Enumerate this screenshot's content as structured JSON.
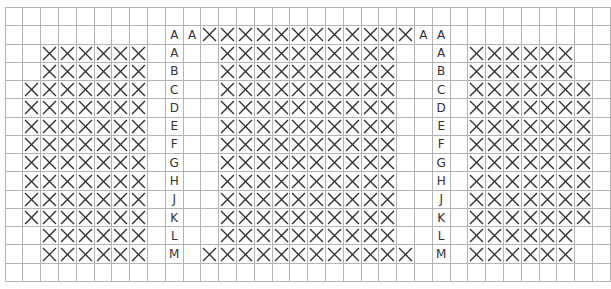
{
  "grid": {
    "columns": 34,
    "rows": 15
  },
  "colors": {
    "grid_line": "#b4b4b4",
    "mark": "#2e2e2e",
    "label": "#333333"
  },
  "mark_symbol": "X",
  "rows": [
    {
      "row_index": 0,
      "labels": [],
      "marked_seats": []
    },
    {
      "row_index": 1,
      "labels": [
        {
          "col": 9,
          "text": "A"
        },
        {
          "col": 10,
          "text": "A"
        },
        {
          "col": 23,
          "text": "A"
        },
        {
          "col": 24,
          "text": "A"
        }
      ],
      "marked_seats": [
        {
          "section": "center",
          "from": 11,
          "to": 22
        }
      ]
    },
    {
      "row_index": 2,
      "labels": [
        {
          "col": 9,
          "text": "A"
        },
        {
          "col": 24,
          "text": "A"
        }
      ],
      "marked_seats": [
        {
          "section": "left",
          "from": 2,
          "to": 7
        },
        {
          "section": "center",
          "from": 12,
          "to": 21
        },
        {
          "section": "right",
          "from": 26,
          "to": 31
        }
      ]
    },
    {
      "row_index": 3,
      "labels": [
        {
          "col": 9,
          "text": "B"
        },
        {
          "col": 24,
          "text": "B"
        }
      ],
      "marked_seats": [
        {
          "section": "left",
          "from": 2,
          "to": 7
        },
        {
          "section": "center",
          "from": 12,
          "to": 21
        },
        {
          "section": "right",
          "from": 26,
          "to": 31
        }
      ]
    },
    {
      "row_index": 4,
      "labels": [
        {
          "col": 9,
          "text": "C"
        },
        {
          "col": 24,
          "text": "C"
        }
      ],
      "marked_seats": [
        {
          "section": "left",
          "from": 1,
          "to": 7
        },
        {
          "section": "center",
          "from": 12,
          "to": 21
        },
        {
          "section": "right",
          "from": 26,
          "to": 32
        }
      ]
    },
    {
      "row_index": 5,
      "labels": [
        {
          "col": 9,
          "text": "D"
        },
        {
          "col": 24,
          "text": "D"
        }
      ],
      "marked_seats": [
        {
          "section": "left",
          "from": 1,
          "to": 7
        },
        {
          "section": "center",
          "from": 12,
          "to": 21
        },
        {
          "section": "right",
          "from": 26,
          "to": 32
        }
      ]
    },
    {
      "row_index": 6,
      "labels": [
        {
          "col": 9,
          "text": "E"
        },
        {
          "col": 24,
          "text": "E"
        }
      ],
      "marked_seats": [
        {
          "section": "left",
          "from": 1,
          "to": 7
        },
        {
          "section": "center",
          "from": 12,
          "to": 21
        },
        {
          "section": "right",
          "from": 26,
          "to": 32
        }
      ]
    },
    {
      "row_index": 7,
      "labels": [
        {
          "col": 9,
          "text": "F"
        },
        {
          "col": 24,
          "text": "F"
        }
      ],
      "marked_seats": [
        {
          "section": "left",
          "from": 1,
          "to": 7
        },
        {
          "section": "center",
          "from": 12,
          "to": 21
        },
        {
          "section": "right",
          "from": 26,
          "to": 32
        }
      ]
    },
    {
      "row_index": 8,
      "labels": [
        {
          "col": 9,
          "text": "G"
        },
        {
          "col": 24,
          "text": "G"
        }
      ],
      "marked_seats": [
        {
          "section": "left",
          "from": 1,
          "to": 7
        },
        {
          "section": "center",
          "from": 12,
          "to": 21
        },
        {
          "section": "right",
          "from": 26,
          "to": 32
        }
      ]
    },
    {
      "row_index": 9,
      "labels": [
        {
          "col": 9,
          "text": "H"
        },
        {
          "col": 24,
          "text": "H"
        }
      ],
      "marked_seats": [
        {
          "section": "left",
          "from": 1,
          "to": 7
        },
        {
          "section": "center",
          "from": 12,
          "to": 21
        },
        {
          "section": "right",
          "from": 26,
          "to": 32
        }
      ]
    },
    {
      "row_index": 10,
      "labels": [
        {
          "col": 9,
          "text": "J"
        },
        {
          "col": 24,
          "text": "J"
        }
      ],
      "marked_seats": [
        {
          "section": "left",
          "from": 1,
          "to": 7
        },
        {
          "section": "center",
          "from": 12,
          "to": 21
        },
        {
          "section": "right",
          "from": 26,
          "to": 32
        }
      ]
    },
    {
      "row_index": 11,
      "labels": [
        {
          "col": 9,
          "text": "K"
        },
        {
          "col": 24,
          "text": "K"
        }
      ],
      "marked_seats": [
        {
          "section": "left",
          "from": 1,
          "to": 7
        },
        {
          "section": "center",
          "from": 12,
          "to": 21
        },
        {
          "section": "right",
          "from": 26,
          "to": 32
        }
      ]
    },
    {
      "row_index": 12,
      "labels": [
        {
          "col": 9,
          "text": "L"
        },
        {
          "col": 24,
          "text": "L"
        }
      ],
      "marked_seats": [
        {
          "section": "left",
          "from": 2,
          "to": 7
        },
        {
          "section": "center",
          "from": 12,
          "to": 21
        },
        {
          "section": "right",
          "from": 26,
          "to": 31
        }
      ]
    },
    {
      "row_index": 13,
      "labels": [
        {
          "col": 9,
          "text": "M"
        },
        {
          "col": 24,
          "text": "M"
        }
      ],
      "marked_seats": [
        {
          "section": "left",
          "from": 2,
          "to": 7
        },
        {
          "section": "center",
          "from": 11,
          "to": 22
        },
        {
          "section": "right",
          "from": 26,
          "to": 31
        }
      ]
    },
    {
      "row_index": 14,
      "labels": [],
      "marked_seats": []
    }
  ]
}
